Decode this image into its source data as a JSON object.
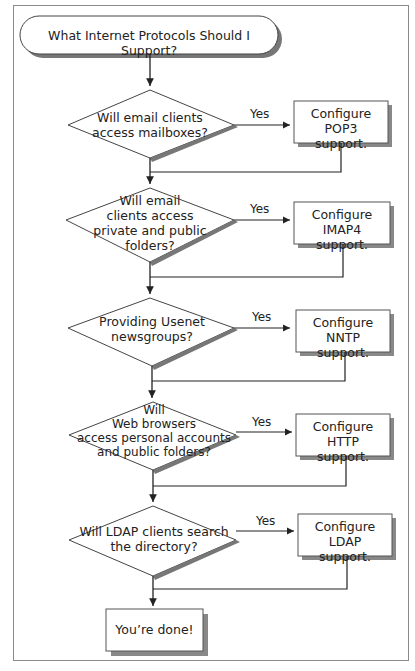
{
  "diagram": {
    "start": {
      "label": "What Internet Protocols Should I Support?"
    },
    "steps": [
      {
        "question": "Will email clients access mailboxes?",
        "question_lines": [
          "Will email clients",
          "access mailboxes?"
        ],
        "branch": "Yes",
        "action": "Configure POP3 support.",
        "action_lines": [
          "Configure POP3",
          "support."
        ]
      },
      {
        "question": "Will email clients access private and public folders?",
        "question_lines": [
          "Will email",
          "clients access",
          "private and public",
          "folders?"
        ],
        "branch": "Yes",
        "action": "Configure IMAP4 support.",
        "action_lines": [
          "Configure IMAP4",
          "support."
        ]
      },
      {
        "question": "Providing Usenet newsgroups?",
        "question_lines": [
          "Providing Usenet",
          "newsgroups?"
        ],
        "branch": "Yes",
        "action": "Configure NNTP support.",
        "action_lines": [
          "Configure NNTP",
          "support."
        ]
      },
      {
        "question": "Will Web browsers access personal accounts and public folders?",
        "question_lines": [
          "Will",
          "Web browsers",
          "access personal accounts",
          "and  public folders?"
        ],
        "branch": "Yes",
        "action": "Configure HTTP support.",
        "action_lines": [
          "Configure HTTP",
          "support."
        ]
      },
      {
        "question": "Will LDAP clients search the directory?",
        "question_lines": [
          "Will LDAP clients search",
          "the directory?"
        ],
        "branch": "Yes",
        "action": "Configure LDAP support.",
        "action_lines": [
          "Configure LDAP",
          "support."
        ]
      }
    ],
    "end": {
      "label": "You’re done!"
    }
  }
}
